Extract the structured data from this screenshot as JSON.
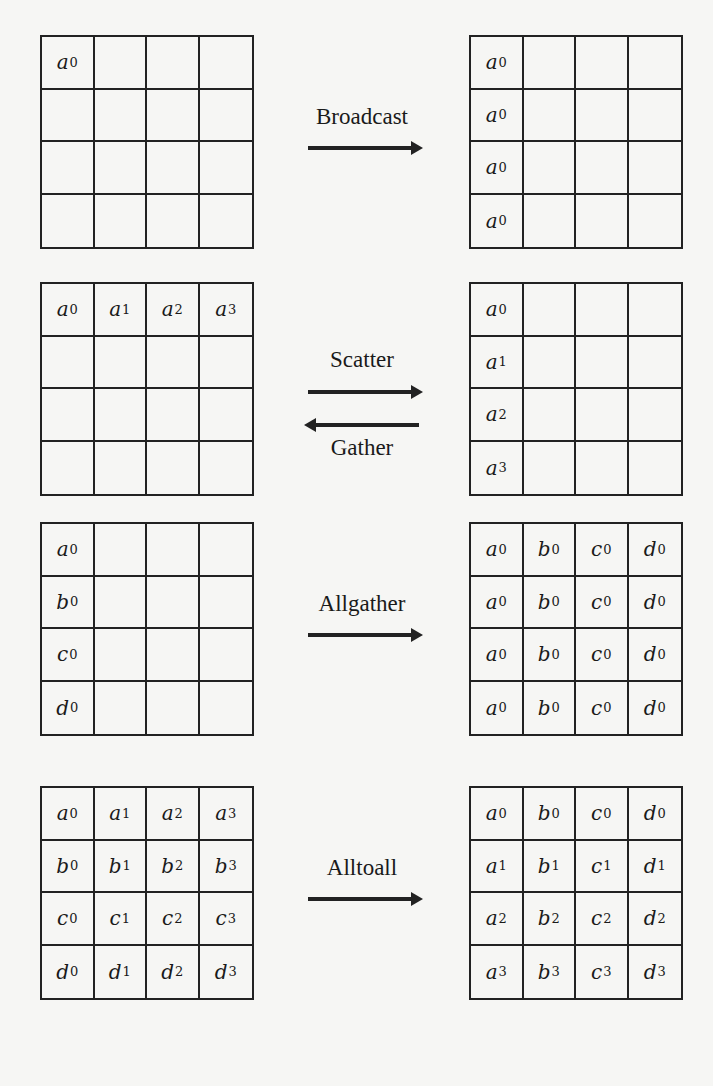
{
  "diagram": {
    "panels": [
      {
        "operation": "Broadcast",
        "direction": "right",
        "before": [
          [
            "a0",
            "",
            "",
            ""
          ],
          [
            "",
            "",
            "",
            ""
          ],
          [
            "",
            "",
            "",
            ""
          ],
          [
            "",
            "",
            "",
            ""
          ]
        ],
        "after": [
          [
            "a0",
            "",
            "",
            ""
          ],
          [
            "a0",
            "",
            "",
            ""
          ],
          [
            "a0",
            "",
            "",
            ""
          ],
          [
            "a0",
            "",
            "",
            ""
          ]
        ]
      },
      {
        "operation": "Scatter",
        "reverse_operation": "Gather",
        "direction": "both",
        "before": [
          [
            "a0",
            "a1",
            "a2",
            "a3"
          ],
          [
            "",
            "",
            "",
            ""
          ],
          [
            "",
            "",
            "",
            ""
          ],
          [
            "",
            "",
            "",
            ""
          ]
        ],
        "after": [
          [
            "a0",
            "",
            "",
            ""
          ],
          [
            "a1",
            "",
            "",
            ""
          ],
          [
            "a2",
            "",
            "",
            ""
          ],
          [
            "a3",
            "",
            "",
            ""
          ]
        ]
      },
      {
        "operation": "Allgather",
        "direction": "right",
        "before": [
          [
            "a0",
            "",
            "",
            ""
          ],
          [
            "b0",
            "",
            "",
            ""
          ],
          [
            "c0",
            "",
            "",
            ""
          ],
          [
            "d0",
            "",
            "",
            ""
          ]
        ],
        "after": [
          [
            "a0",
            "b0",
            "c0",
            "d0"
          ],
          [
            "a0",
            "b0",
            "c0",
            "d0"
          ],
          [
            "a0",
            "b0",
            "c0",
            "d0"
          ],
          [
            "a0",
            "b0",
            "c0",
            "d0"
          ]
        ]
      },
      {
        "operation": "Alltoall",
        "direction": "right",
        "before": [
          [
            "a0",
            "a1",
            "a2",
            "a3"
          ],
          [
            "b0",
            "b1",
            "b2",
            "b3"
          ],
          [
            "c0",
            "c1",
            "c2",
            "c3"
          ],
          [
            "d0",
            "d1",
            "d2",
            "d3"
          ]
        ],
        "after": [
          [
            "a0",
            "b0",
            "c0",
            "d0"
          ],
          [
            "a1",
            "b1",
            "c1",
            "d1"
          ],
          [
            "a2",
            "b2",
            "c2",
            "d2"
          ],
          [
            "a3",
            "b3",
            "c3",
            "d3"
          ]
        ]
      }
    ],
    "layout": {
      "left_x": 40,
      "right_x": 469,
      "grid_width": 214,
      "grid_height": 214,
      "panel_tops": [
        35,
        282,
        522,
        786
      ]
    }
  }
}
